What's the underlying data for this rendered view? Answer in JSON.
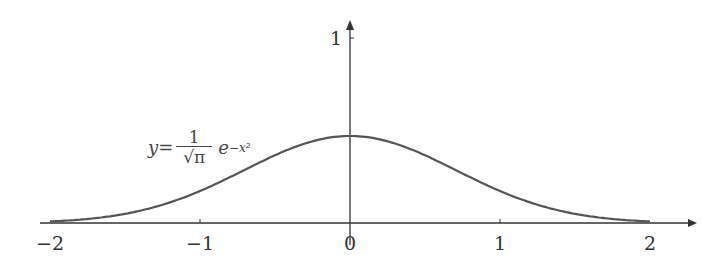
{
  "chart_data": {
    "type": "line",
    "title": "",
    "xlabel": "",
    "ylabel": "",
    "xlim": [
      -2,
      2
    ],
    "ylim": [
      0,
      1
    ],
    "x_ticks": [
      "−2",
      "−1",
      "0",
      "1",
      "2"
    ],
    "y_ticks": [
      "1"
    ],
    "series": [
      {
        "name": "y = (1/√π) e^(−x²)",
        "x": [
          -2,
          -1.5,
          -1,
          -0.5,
          0,
          0.5,
          1,
          1.5,
          2
        ],
        "values": [
          0.01,
          0.06,
          0.208,
          0.439,
          0.564,
          0.439,
          0.208,
          0.06,
          0.01
        ]
      }
    ],
    "annotations": [
      "y = 1/√π e^{−x²}"
    ],
    "grid": false
  },
  "labels": {
    "x_ticks": [
      "−2",
      "−1",
      "0",
      "1",
      "2"
    ],
    "y_tick": "1",
    "formula_y": "y=",
    "formula_num": "1",
    "formula_den": "√π",
    "formula_exp_base": "e",
    "formula_exp": "−x²"
  }
}
